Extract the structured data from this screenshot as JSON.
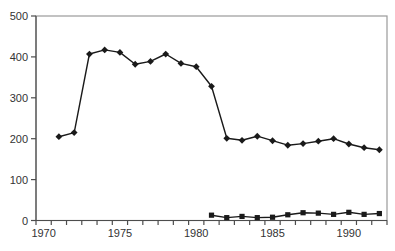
{
  "window": {
    "background": "#ffffff"
  },
  "colors": {
    "background": "#ffffff",
    "plot_frame": "#9a9a9a",
    "axis": "#4d4d4d",
    "tick_label": "#333333",
    "series": "#1a1a1a"
  },
  "chart_data": {
    "type": "line",
    "title": "",
    "xlabel": "",
    "ylabel": "",
    "grid": false,
    "legend": "none",
    "x_axis": {
      "range": [
        1970,
        1992
      ],
      "tick_labels": [
        1970,
        1975,
        1980,
        1985,
        1990
      ],
      "minor_tick_interval_years": 1,
      "ticks_between_categories": true
    },
    "y_axis": {
      "range": [
        0,
        500
      ],
      "tick_labels": [
        0,
        100,
        200,
        300,
        400,
        500
      ]
    },
    "series": [
      {
        "name": "diamond-series",
        "marker": "diamond",
        "color": "#1a1a1a",
        "points": [
          [
            1971,
            205
          ],
          [
            1972,
            215
          ],
          [
            1973,
            407
          ],
          [
            1974,
            417
          ],
          [
            1975,
            411
          ],
          [
            1976,
            382
          ],
          [
            1977,
            389
          ],
          [
            1978,
            407
          ],
          [
            1979,
            384
          ],
          [
            1980,
            376
          ],
          [
            1981,
            328
          ],
          [
            1982,
            201
          ],
          [
            1983,
            196
          ],
          [
            1984,
            206
          ],
          [
            1985,
            195
          ],
          [
            1986,
            184
          ],
          [
            1987,
            188
          ],
          [
            1988,
            194
          ],
          [
            1989,
            200
          ],
          [
            1990,
            187
          ],
          [
            1991,
            178
          ],
          [
            1992,
            173
          ]
        ]
      },
      {
        "name": "square-series",
        "marker": "square",
        "color": "#1a1a1a",
        "points": [
          [
            1981,
            13
          ],
          [
            1982,
            7
          ],
          [
            1983,
            10
          ],
          [
            1984,
            7
          ],
          [
            1985,
            8
          ],
          [
            1986,
            14
          ],
          [
            1987,
            19
          ],
          [
            1988,
            18
          ],
          [
            1989,
            15
          ],
          [
            1990,
            20
          ],
          [
            1991,
            15
          ],
          [
            1992,
            17
          ]
        ]
      }
    ]
  }
}
